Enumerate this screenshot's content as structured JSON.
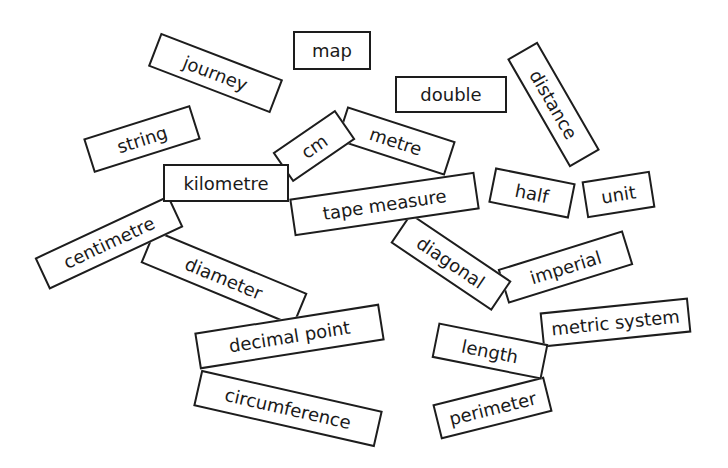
{
  "worksheet": {
    "background_color": "#ffffff",
    "card_border_color": "#1d1d1d",
    "text_color": "#1a1a1a",
    "cards": [
      {
        "label": "journey"
      },
      {
        "label": "map"
      },
      {
        "label": "string"
      },
      {
        "label": "double"
      },
      {
        "label": "distance"
      },
      {
        "label": "metre"
      },
      {
        "label": "cm"
      },
      {
        "label": "diameter"
      },
      {
        "label": "centimetre"
      },
      {
        "label": "kilometre"
      },
      {
        "label": "imperial"
      },
      {
        "label": "diagonal"
      },
      {
        "label": "tape measure"
      },
      {
        "label": "half"
      },
      {
        "label": "unit"
      },
      {
        "label": "circumference"
      },
      {
        "label": "decimal point"
      },
      {
        "label": "metric system"
      },
      {
        "label": "perimeter"
      },
      {
        "label": "length"
      }
    ]
  }
}
